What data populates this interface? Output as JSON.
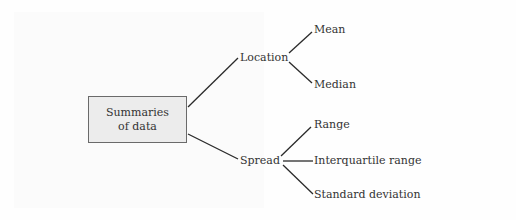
{
  "diagram": {
    "type": "tree",
    "root": {
      "line1": "Summaries",
      "line2": "of data"
    },
    "branches": [
      {
        "label": "Location",
        "children": [
          {
            "label": "Mean"
          },
          {
            "label": "Median"
          }
        ]
      },
      {
        "label": "Spread",
        "children": [
          {
            "label": "Range"
          },
          {
            "label": "Interquartile range"
          },
          {
            "label": "Standard deviation"
          }
        ]
      }
    ],
    "colors": {
      "box_fill": "#ececec",
      "box_border": "#6a6a6a",
      "line": "#2a2a2a",
      "text": "#333333"
    }
  }
}
